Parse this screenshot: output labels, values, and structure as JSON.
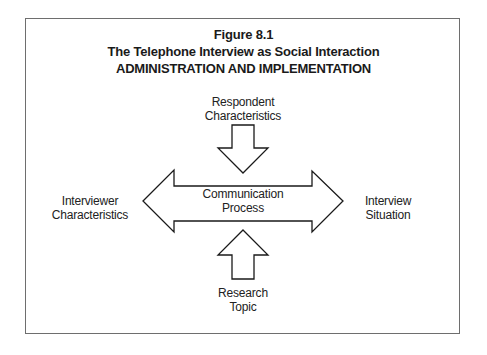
{
  "figure": {
    "number": "Figure 8.1",
    "title": "The Telephone Interview as Social Interaction",
    "subtitle": "ADMINISTRATION AND IMPLEMENTATION"
  },
  "nodes": {
    "top": {
      "line1": "Respondent",
      "line2": "Characteristics"
    },
    "left": {
      "line1": "Interviewer",
      "line2": "Characteristics"
    },
    "center": {
      "line1": "Communication",
      "line2": "Process"
    },
    "right": {
      "line1": "Interview",
      "line2": "Situation"
    },
    "bottom": {
      "line1": "Research",
      "line2": "Topic"
    }
  },
  "edges": [
    {
      "from": "top",
      "to": "center",
      "shape": "block-arrow-down"
    },
    {
      "from": "bottom",
      "to": "center",
      "shape": "block-arrow-up"
    },
    {
      "from": "center",
      "to": "left",
      "shape": "double-headed-block-arrow"
    },
    {
      "from": "center",
      "to": "right",
      "shape": "double-headed-block-arrow"
    }
  ],
  "colors": {
    "stroke": "#1a1a1a",
    "frame": "#6e6e6e",
    "background": "#ffffff"
  }
}
